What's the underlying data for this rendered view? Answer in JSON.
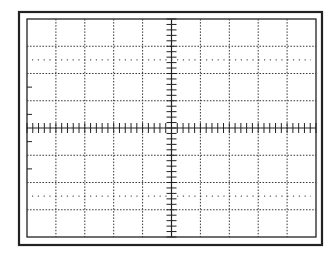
{
  "graticule": {
    "title": "Oscilloscope graticule",
    "divisions_x": 10,
    "divisions_y": 8,
    "minor_ticks_per_division": 5,
    "outer_frame": {
      "x": 19,
      "y": 12,
      "w": 303,
      "h": 233
    },
    "inner_frame": {
      "x": 27,
      "y": 19,
      "w": 289,
      "h": 218
    },
    "dotted_reference_lines": [
      "upper",
      "lower"
    ],
    "colors": {
      "background": "#ffffff",
      "line": "#222222",
      "grid": "#333333"
    }
  }
}
